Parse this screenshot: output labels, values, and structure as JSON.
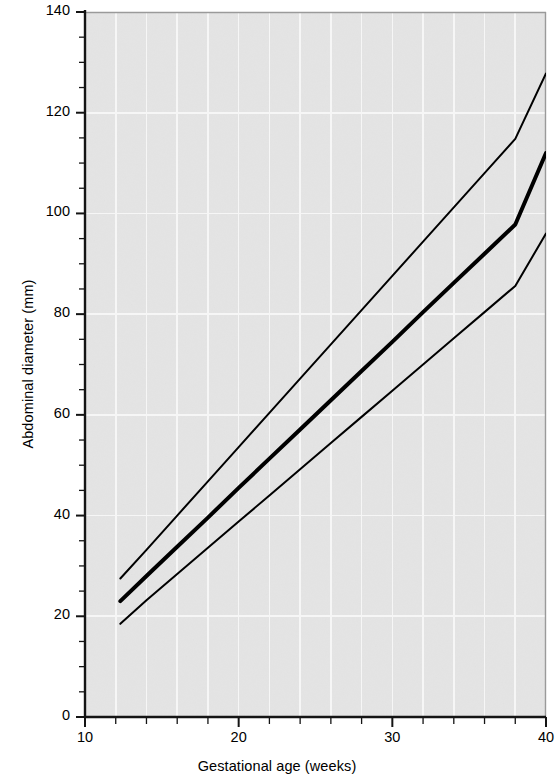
{
  "figure": {
    "background_color": "#ffffff",
    "plot_background_color": "#e4e4e4",
    "gridline_color": "#f7f7f7",
    "axis_color": "#1a1a1a",
    "line_color": "#000000"
  },
  "axes": {
    "x_title": "Gestational age (weeks)",
    "y_title": "Abdominal diameter (mm)",
    "x_tick_labels": [
      "10",
      "20",
      "30",
      "40"
    ],
    "y_tick_labels": [
      "0",
      "20",
      "40",
      "60",
      "80",
      "100",
      "120",
      "140"
    ]
  },
  "chart_data": {
    "type": "line",
    "title": "",
    "subtitle": "",
    "xlabel": "Gestational age (weeks)",
    "ylabel": "Abdominal diameter (mm)",
    "xlim": [
      10,
      40
    ],
    "ylim": [
      0,
      140
    ],
    "xticks": [
      10,
      20,
      30,
      40
    ],
    "yticks": [
      0,
      20,
      40,
      60,
      80,
      100,
      120,
      140
    ],
    "x_minor_tick_step": 2,
    "y_minor_tick_step": 5,
    "grid": true,
    "grid_x_step": 2,
    "grid_y_step": 20,
    "legend": null,
    "legend_position": "none",
    "annotations": [],
    "x": [
      12.3,
      14,
      16,
      18,
      20,
      22,
      24,
      26,
      28,
      30,
      32,
      34,
      36,
      38,
      40
    ],
    "series": [
      {
        "name": "Upper reference limit (95th centile)",
        "line_width_px": 2,
        "values": [
          27.5,
          33.2,
          40.0,
          46.8,
          53.6,
          60.4,
          67.2,
          74.0,
          80.8,
          87.6,
          94.4,
          101.2,
          108.0,
          114.8,
          127.8
        ]
      },
      {
        "name": "Mean (50th centile)",
        "line_width_px": 4,
        "values": [
          23.0,
          28.0,
          33.8,
          39.6,
          45.5,
          51.3,
          57.1,
          62.9,
          68.7,
          74.5,
          80.4,
          86.2,
          92.0,
          97.8,
          112.0
        ]
      },
      {
        "name": "Lower reference limit (5th centile)",
        "line_width_px": 2,
        "values": [
          18.5,
          23.2,
          28.4,
          33.6,
          38.8,
          44.0,
          49.2,
          54.4,
          59.6,
          64.8,
          70.0,
          75.2,
          80.4,
          85.6,
          96.0
        ]
      }
    ]
  }
}
